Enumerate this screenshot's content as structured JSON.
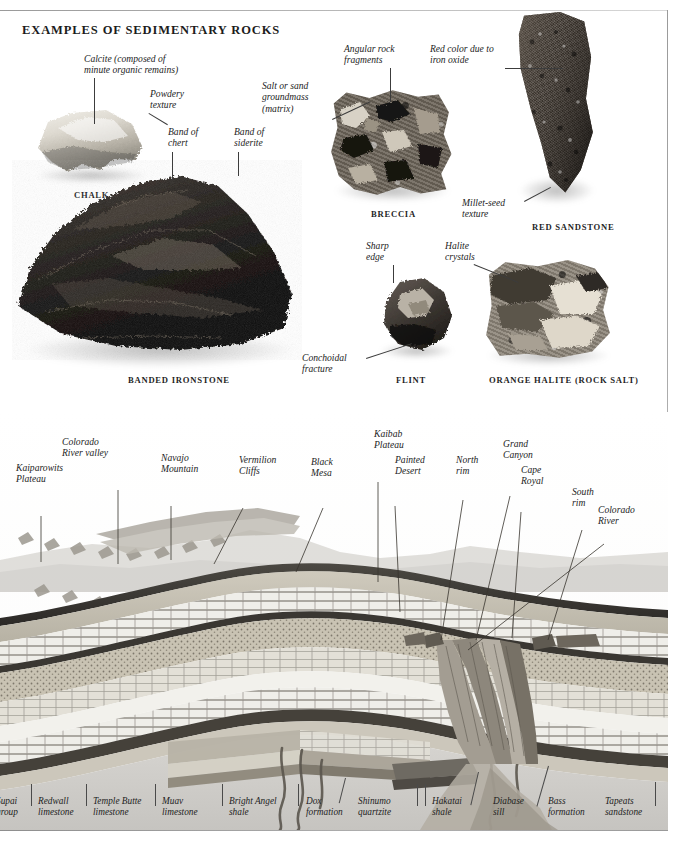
{
  "plate": {
    "title": "EXAMPLES OF SEDIMENTARY ROCKS"
  },
  "specimens": [
    {
      "id": "chalk",
      "caption": "CHALK",
      "color": "#d9d6cd",
      "labels": [
        {
          "text": "Calcite (composed of\nminute organic remains)"
        },
        {
          "text": "Powdery\ntexture"
        }
      ]
    },
    {
      "id": "banded-ironstone",
      "caption": "BANDED IRONSTONE",
      "color": "#1b1916",
      "labels": [
        {
          "text": "Band of\nchert"
        },
        {
          "text": "Band of\nsiderite"
        }
      ]
    },
    {
      "id": "breccia",
      "caption": "BRECCIA",
      "color": "#6f675c",
      "labels": [
        {
          "text": "Angular rock\nfragments"
        },
        {
          "text": "Salt or sand\ngroundmass\n(matrix)"
        }
      ]
    },
    {
      "id": "red-sandstone",
      "caption": "RED SANDSTONE",
      "color": "#4a423a",
      "labels": [
        {
          "text": "Red color due to\niron oxide"
        },
        {
          "text": "Millet-seed\ntexture"
        }
      ]
    },
    {
      "id": "flint",
      "caption": "FLINT",
      "color": "#4f4a44",
      "labels": [
        {
          "text": "Sharp\nedge"
        },
        {
          "text": "Conchoidal\nfracture"
        }
      ]
    },
    {
      "id": "orange-halite",
      "caption": "ORANGE HALITE (ROCK SALT)",
      "color": "#8e867a",
      "labels": [
        {
          "text": "Halite\ncrystals"
        }
      ]
    }
  ],
  "cross_section": {
    "feature_labels": [
      {
        "id": "kaiparowits-plateau",
        "text": "Kaiparowits\nPlateau"
      },
      {
        "id": "colorado-river-valley",
        "text": "Colorado\nRiver valley"
      },
      {
        "id": "navajo-mountain",
        "text": "Navajo\nMountain"
      },
      {
        "id": "vermilion-cliffs",
        "text": "Vermilion\nCliffs"
      },
      {
        "id": "black-mesa",
        "text": "Black\nMesa"
      },
      {
        "id": "kaibab-plateau",
        "text": "Kaibab\nPlateau"
      },
      {
        "id": "painted-desert",
        "text": "Painted\nDesert"
      },
      {
        "id": "north-rim",
        "text": "North\nrim"
      },
      {
        "id": "grand-canyon",
        "text": "Grand\nCanyon"
      },
      {
        "id": "cape-royal",
        "text": "Cape\nRoyal"
      },
      {
        "id": "south-rim",
        "text": "South\nrim"
      },
      {
        "id": "colorado-river",
        "text": "Colorado\nRiver"
      }
    ],
    "strata_labels": [
      {
        "id": "supai-group",
        "text": "Supai\ngroup"
      },
      {
        "id": "redwall-limestone",
        "text": "Redwall\nlimestone"
      },
      {
        "id": "temple-butte-limestone",
        "text": "Temple Butte\nlimestone"
      },
      {
        "id": "muav-limestone",
        "text": "Muav\nlimestone"
      },
      {
        "id": "bright-angel-shale",
        "text": "Bright Angel\nshale"
      },
      {
        "id": "dox-formation",
        "text": "Dox\nformation"
      },
      {
        "id": "shinumo-quartzite",
        "text": "Shinumo\nquartzite"
      },
      {
        "id": "hakatai-shale",
        "text": "Hakatai\nshale"
      },
      {
        "id": "diabase-sill",
        "text": "Diabase\nsill"
      },
      {
        "id": "bass-formation",
        "text": "Bass\nformation"
      },
      {
        "id": "tapeats-sandstone",
        "text": "Tapeats\nsandstone"
      }
    ]
  }
}
